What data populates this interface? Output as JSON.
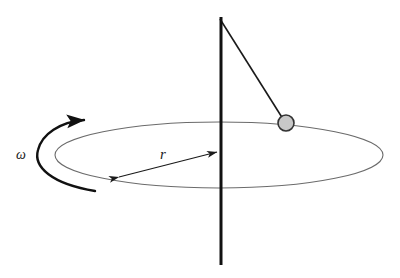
{
  "figure": {
    "type": "physics-diagram",
    "background_color": "#ffffff",
    "width": 400,
    "height": 278
  },
  "labels": {
    "radius": "r",
    "angular_velocity": "ω"
  },
  "elements": {
    "vertical_axis": {
      "name": "rotation-axis",
      "color": "#111111",
      "stroke_width": 3,
      "x": 221,
      "y_top": 17,
      "y_bottom": 265
    },
    "string": {
      "name": "pendulum-string",
      "color": "#1a1a1a",
      "stroke_width": 1.6,
      "x1": 220,
      "y1": 18,
      "x2": 284,
      "y2": 120
    },
    "bob": {
      "name": "pendulum-bob",
      "fill": "#c8c8c8",
      "stroke": "#333333",
      "stroke_width": 1.6,
      "cx": 286,
      "cy": 123,
      "r": 8
    },
    "orbit_ellipse": {
      "name": "circular-orbit-path",
      "stroke": "#6b6b6b",
      "stroke_width": 1.1,
      "cx": 219,
      "cy": 155,
      "rx": 164,
      "ry": 33
    },
    "radius_arrow": {
      "name": "radius-measure-arrow",
      "stroke": "#1a1a1a",
      "stroke_width": 1.2,
      "x1": 117,
      "y1": 178,
      "x2": 219,
      "y2": 152,
      "double_headed": true
    },
    "rotation_arc": {
      "name": "rotation-direction-arrow",
      "stroke": "#111111",
      "stroke_width": 2.4,
      "direction": "counterclockwise-from-below",
      "arrowhead_at": "top-right"
    }
  },
  "label_positions": {
    "radius": {
      "x": 160,
      "y": 159
    },
    "angular_velocity": {
      "x": 16,
      "y": 159
    }
  }
}
